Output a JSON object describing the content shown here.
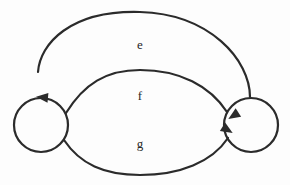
{
  "diagram": {
    "background_color": "#fdfdfd",
    "stroke_color": "#2b2b2b",
    "label_color": "#262626",
    "stroke_width": 2.2,
    "nodes": [
      {
        "id": "left",
        "name": "left-state-node",
        "label": "",
        "cx": 41,
        "cy": 125,
        "r": 27
      },
      {
        "id": "right",
        "name": "right-state-node",
        "label": "",
        "cx": 251,
        "cy": 125,
        "r": 27
      }
    ],
    "edges": [
      {
        "id": "e",
        "name": "edge-e",
        "label": "e",
        "from": "right",
        "to": "left",
        "direction": "right-to-left",
        "label_x": 140,
        "label_y": 46,
        "apex_y": 12,
        "path": "M 250 97 C 250 60 210 14 140 12 C 70 10 40 44 38 72",
        "arrow_x": 38,
        "arrow_y": 97,
        "arrow_angle": 95
      },
      {
        "id": "f",
        "name": "edge-f",
        "label": "f",
        "from": "left",
        "to": "right",
        "direction": "left-to-right",
        "label_x": 140,
        "label_y": 97,
        "apex_y": 70,
        "path": "M 66 113 C 84 84 106 70 140 70 C 180 70 210 86 227 112",
        "arrow_x": 230,
        "arrow_y": 118,
        "arrow_angle": 57
      },
      {
        "id": "g",
        "name": "edge-g",
        "label": "g",
        "from": "left",
        "to": "right",
        "direction": "left-to-right",
        "label_x": 140,
        "label_y": 145,
        "apex_y": 175,
        "path": "M 64 140 C 80 164 104 175 140 175 C 180 175 212 162 228 138",
        "arrow_x": 231,
        "arrow_y": 132,
        "arrow_angle": -58
      }
    ]
  }
}
